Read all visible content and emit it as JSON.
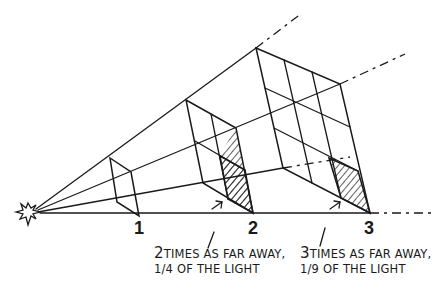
{
  "diagram": {
    "source_icon": "light-source-burst",
    "distance_labels": [
      "1",
      "2",
      "3"
    ],
    "captions": [
      {
        "distance": "2",
        "line1": "TIMES AS FAR AWAY,",
        "fraction": "1/4",
        "line2": "OF THE LIGHT"
      },
      {
        "distance": "3",
        "line1": "TIMES AS FAR AWAY,",
        "fraction": "1/9",
        "line2": "OF THE LIGHT"
      }
    ],
    "frames": [
      {
        "distance": 1,
        "grid": "1x1",
        "shaded_cells": 1
      },
      {
        "distance": 2,
        "grid": "2x2",
        "shaded_cells": 1
      },
      {
        "distance": 3,
        "grid": "3x3",
        "shaded_cells": 1
      }
    ],
    "colors": {
      "ink": "#1a1a1a",
      "background": "#ffffff"
    }
  }
}
